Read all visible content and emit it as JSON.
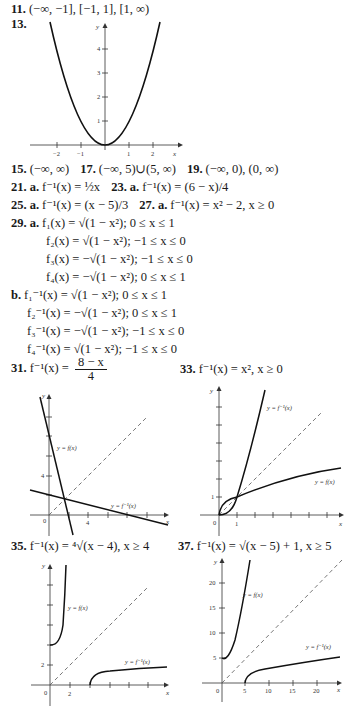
{
  "answers": {
    "a11": {
      "num": "11.",
      "text": "(−∞, −1], [−1, 1], [1, ∞)"
    },
    "a13": {
      "num": "13."
    },
    "row15": {
      "a15": {
        "num": "15.",
        "text": "(−∞, ∞)"
      },
      "a17": {
        "num": "17.",
        "text": "(−∞, 5)∪(5, ∞)"
      },
      "a19": {
        "num": "19.",
        "text": "(−∞, 0), (0, ∞)"
      }
    },
    "row21": {
      "a21": {
        "num": "21.",
        "part": "a.",
        "text": "f⁻¹(x) = ½x"
      },
      "a23": {
        "num": "23.",
        "part": "a.",
        "text": "f⁻¹(x) = (6 − x)/4"
      }
    },
    "row25": {
      "a25": {
        "num": "25.",
        "part": "a.",
        "text": "f⁻¹(x) = (x − 5)/3"
      },
      "a27": {
        "num": "27.",
        "part": "a.",
        "text": "f⁻¹(x) = x² − 2, x ≥ 0"
      }
    },
    "a29": {
      "num": "29.",
      "part_a": "a.",
      "a_lines": [
        "f₁(x) = √(1 − x²);  0 ≤ x ≤ 1",
        "f₂(x) = √(1 − x²);  −1 ≤ x ≤ 0",
        "f₃(x) = −√(1 − x²);  −1 ≤ x ≤ 0",
        "f₄(x) = −√(1 − x²);  0 ≤ x ≤ 1"
      ],
      "part_b": "b.",
      "b_lines": [
        "f₁⁻¹(x) = √(1 − x²);  0 ≤ x ≤ 1",
        "f₂⁻¹(x) = −√(1 − x²);  0 ≤ x ≤ 1",
        "f₃⁻¹(x) = −√(1 − x²);  −1 ≤ x ≤ 0",
        "f₄⁻¹(x) = √(1 − x²);  −1 ≤ x ≤ 0"
      ]
    },
    "a31": {
      "num": "31.",
      "lhs": "f⁻¹(x) =",
      "numerator": "8 − x",
      "denominator": "4"
    },
    "a33": {
      "num": "33.",
      "text": "f⁻¹(x) = x², x ≥ 0"
    },
    "a35": {
      "num": "35.",
      "text": "f⁻¹(x) = ⁴√(x − 4), x ≥ 4"
    },
    "a37": {
      "num": "37.",
      "text": "f⁻¹(x) = √(x − 5) + 1, x ≥ 5"
    }
  },
  "graphs": {
    "g13": {
      "y_label": "y",
      "x_label": "x",
      "x_ticks": [
        "−2",
        "−1",
        "1",
        "2"
      ],
      "y_ticks": [
        "1",
        "2",
        "3",
        "4"
      ]
    },
    "g31": {
      "y_label": "y",
      "x_label": "x",
      "origin": "0",
      "x_tick_label": "4",
      "y_tick_label": "4",
      "f_label": "y = f(x)",
      "finv_label": "y = f⁻¹(x)"
    },
    "g33": {
      "y_label": "y",
      "x_label": "x",
      "origin": "0",
      "x_tick_label": "1",
      "y_tick_label": "1",
      "f_label": "y = f(x)",
      "finv_label": "y = f⁻¹(x)"
    },
    "g35": {
      "y_label": "y",
      "x_label": "x",
      "origin": "0",
      "x_tick_label": "2",
      "y_tick_label": "2",
      "f_label": "y = f(x)",
      "finv_label": "y = f⁻¹(x)"
    },
    "g37": {
      "y_label": "y",
      "x_label": "x",
      "origin": "0",
      "x_ticks": [
        "5",
        "10",
        "15",
        "20"
      ],
      "y_ticks": [
        "5",
        "10",
        "15",
        "20"
      ],
      "f_label": "y = f(x)",
      "finv_label": "y = f⁻¹(x)"
    }
  }
}
